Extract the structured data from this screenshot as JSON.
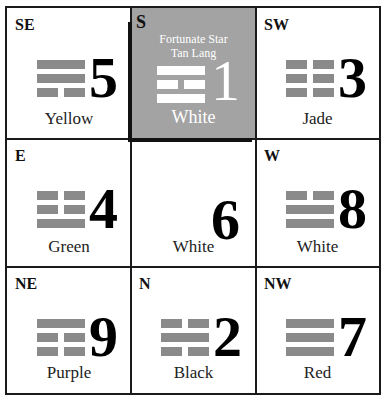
{
  "trigram_color": "#8a8a8a",
  "highlight_bg": "#a3a3a3",
  "cells": [
    {
      "dir": "SE",
      "number": "5",
      "color": "Yellow",
      "trigram": [
        "solid",
        "solid",
        "broken"
      ]
    },
    {
      "dir": "S",
      "number": "1",
      "color": "White",
      "trigram": [
        "solid",
        "broken",
        "solid"
      ],
      "highlight": true,
      "star_line1": "Fortunate Star",
      "star_line2": "Tan Lang"
    },
    {
      "dir": "SW",
      "number": "3",
      "color": "Jade",
      "trigram": [
        "broken",
        "broken",
        "broken"
      ]
    },
    {
      "dir": "E",
      "number": "4",
      "color": "Green",
      "trigram": [
        "broken",
        "broken",
        "solid"
      ]
    },
    {
      "dir": "",
      "number": "6",
      "color": "White",
      "trigram": []
    },
    {
      "dir": "W",
      "number": "8",
      "color": "White",
      "trigram": [
        "broken",
        "solid",
        "solid"
      ]
    },
    {
      "dir": "NE",
      "number": "9",
      "color": "Purple",
      "trigram": [
        "solid",
        "broken",
        "broken"
      ]
    },
    {
      "dir": "N",
      "number": "2",
      "color": "Black",
      "trigram": [
        "broken",
        "solid",
        "broken"
      ]
    },
    {
      "dir": "NW",
      "number": "7",
      "color": "Red",
      "trigram": [
        "solid",
        "solid",
        "solid"
      ]
    }
  ]
}
